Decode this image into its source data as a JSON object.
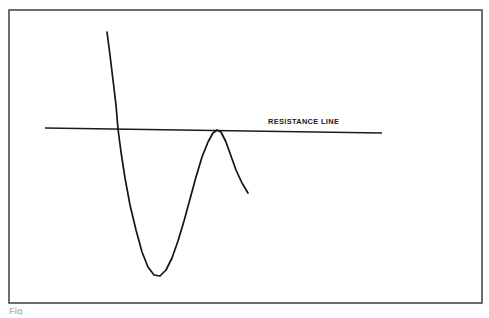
{
  "figure": {
    "background_color": "#ffffff",
    "frame": {
      "stroke_color": "#4a4a4a",
      "x": 9,
      "y": 10,
      "width": 473,
      "height": 293
    },
    "caption_fragment": "Fig"
  },
  "annotations": {
    "resistance_label": "RESISTANCE LINE"
  },
  "chart_data": {
    "type": "line",
    "title": "",
    "subtitle": "",
    "xlabel": "",
    "ylabel": "",
    "grid": false,
    "legend_position": "none",
    "axis_visible": false,
    "xlim": [
      0,
      489
    ],
    "ylim": [
      318,
      0
    ],
    "series": [
      {
        "name": "price-curve",
        "color": "#141414",
        "description": "Sharp decline into a rounded trough, strong rally to a peak that touches the resistance line, then renewed decline",
        "points": [
          [
            107,
            32
          ],
          [
            110,
            55
          ],
          [
            113,
            80
          ],
          [
            116,
            105
          ],
          [
            118,
            129
          ],
          [
            121,
            152
          ],
          [
            125,
            178
          ],
          [
            130,
            205
          ],
          [
            136,
            230
          ],
          [
            142,
            252
          ],
          [
            148,
            267
          ],
          [
            154,
            275
          ],
          [
            160,
            276
          ],
          [
            166,
            270
          ],
          [
            172,
            258
          ],
          [
            178,
            241
          ],
          [
            184,
            221
          ],
          [
            190,
            199
          ],
          [
            196,
            177
          ],
          [
            202,
            157
          ],
          [
            208,
            142
          ],
          [
            213,
            133
          ],
          [
            217,
            130
          ],
          [
            221,
            132
          ],
          [
            226,
            142
          ],
          [
            231,
            156
          ],
          [
            236,
            170
          ],
          [
            242,
            183
          ],
          [
            248,
            193
          ]
        ]
      },
      {
        "name": "resistance-line",
        "color": "#1b1b1b",
        "description": "Slightly downward-sloping resistance trendline touched by the rally peak",
        "points": [
          [
            45,
            128
          ],
          [
            382,
            133
          ]
        ]
      }
    ],
    "annotations": [
      {
        "text": "RESISTANCE LINE",
        "x": 268,
        "y": 121,
        "anchor": "start"
      }
    ],
    "touch_points": [
      {
        "label": "peak-touch",
        "x": 217,
        "y": 130
      }
    ]
  }
}
